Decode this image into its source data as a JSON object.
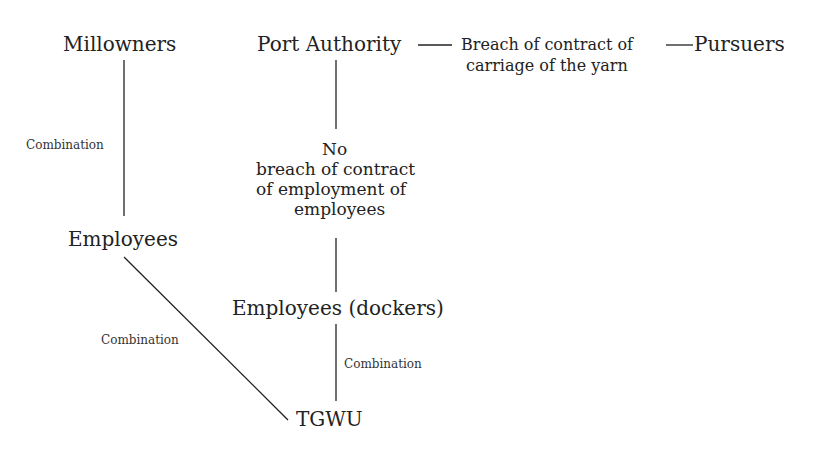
{
  "nodes": {
    "millowners": "Millowners",
    "port_authority": "Port Authority",
    "pursuers": "Pursuers",
    "employees": "Employees",
    "dockers": "Employees (dockers)",
    "tgwu": "TGWU"
  },
  "edge_labels": {
    "breach_line1": "Breach of contract of",
    "breach_line2": "carriage of the yarn",
    "no": "No",
    "no_breach_line1": "breach of contract",
    "no_breach_line2": "of employment of",
    "no_breach_line3": "employees",
    "combination_left": "Combination",
    "combination_diag": "Combination",
    "combination_right": "Combination"
  }
}
